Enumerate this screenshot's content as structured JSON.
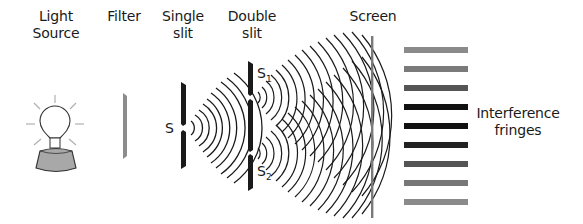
{
  "labels": {
    "light_source": [
      "Light",
      "Source"
    ],
    "filter": [
      "Filter"
    ],
    "single_slit": [
      "Single",
      "slit"
    ],
    "double_slit": [
      "Double",
      "slit"
    ],
    "screen": [
      "Screen"
    ],
    "interference_fringes": [
      "Interference",
      "fringes"
    ]
  },
  "slit_labels": {
    "single": "S",
    "s1_main": "S",
    "s1_sub": "1",
    "s2_main": "S",
    "s2_sub": "2"
  },
  "components": [
    {
      "name": "light-source",
      "icon": "light-bulb-icon"
    },
    {
      "name": "filter",
      "color": "#8c8c8c"
    },
    {
      "name": "single-slit",
      "color": "#1a1a1a"
    },
    {
      "name": "double-slit",
      "color": "#1a1a1a"
    },
    {
      "name": "screen",
      "color": "#7a7a7a"
    }
  ],
  "fringes": [
    {
      "y": 50,
      "color": "#8a8a8a"
    },
    {
      "y": 69,
      "color": "#7a7a7a"
    },
    {
      "y": 88,
      "color": "#555555"
    },
    {
      "y": 107,
      "color": "#111111"
    },
    {
      "y": 126,
      "color": "#111111"
    },
    {
      "y": 145,
      "color": "#222222"
    },
    {
      "y": 164,
      "color": "#555555"
    },
    {
      "y": 183,
      "color": "#777777"
    },
    {
      "y": 202,
      "color": "#8a8a8a"
    }
  ],
  "colors": {
    "ink": "#1a1a1a",
    "bulb_base": "#a8a8a8",
    "rays": "#b0b0b0"
  }
}
